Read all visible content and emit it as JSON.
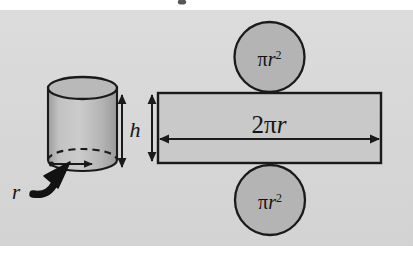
{
  "figure": {
    "background_color": "#ffffff",
    "panel_color": "#d9d9d9",
    "shape_fill": "#b3b3b3",
    "shape_fill_light": "#c4c4c4",
    "outline_color": "#1a1a1a",
    "label_color": "#141414"
  },
  "labels": {
    "height": "h",
    "radius": "r",
    "rect_width_pi": "2π",
    "rect_width_r": "r",
    "circle_area_pi": "π",
    "circle_area_r": "r",
    "circle_area_exp": "2"
  },
  "parts": {
    "cylinder": {
      "name": "cylinder",
      "label": "h",
      "radius_label": "r"
    },
    "rectangle": {
      "name": "lateral-surface-rectangle",
      "width_label": "2πr",
      "height_label": "h"
    },
    "top_circle": {
      "name": "top-cap-circle",
      "area_label": "πr²"
    },
    "bottom_circle": {
      "name": "bottom-cap-circle",
      "area_label": "πr²"
    }
  }
}
